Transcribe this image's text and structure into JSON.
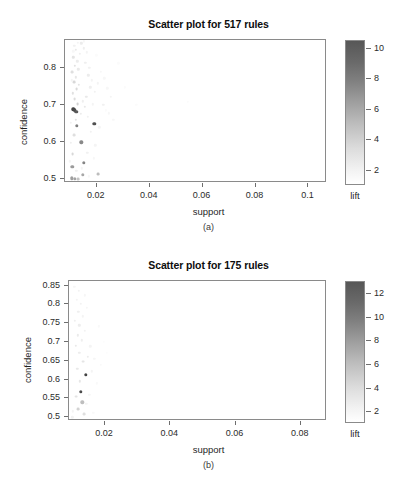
{
  "figures": [
    {
      "id": "a",
      "caption": "(a)",
      "title": "Scatter plot for 517 rules",
      "chart_data": {
        "type": "scatter",
        "title": "Scatter plot for 517 rules",
        "xlabel": "support",
        "ylabel": "confidence",
        "legend_title": "lift",
        "legend_position": "right",
        "grid": false,
        "colormap": "grey (white = low lift, dark grey = high lift)",
        "xlim": [
          0.008,
          0.107
        ],
        "ylim": [
          0.49,
          0.875
        ],
        "xticks": [
          0.02,
          0.04,
          0.06,
          0.08,
          0.1
        ],
        "xtick_labels": [
          "0.02",
          "0.04",
          "0.06",
          "0.08",
          "0.1"
        ],
        "yticks": [
          0.5,
          0.6,
          0.7,
          0.8
        ],
        "ytick_labels": [
          "0.5",
          "0.6",
          "0.7",
          "0.8"
        ],
        "color_range": [
          1,
          10.5
        ],
        "color_ticks": [
          2,
          4,
          6,
          8,
          10
        ],
        "color_tick_labels": [
          "2",
          "4",
          "6",
          "8",
          "10"
        ],
        "n_rules": 517,
        "points": [
          {
            "support": 0.0112,
            "confidence": 0.688,
            "lift": 9.8
          },
          {
            "support": 0.0118,
            "confidence": 0.686,
            "lift": 9.4
          },
          {
            "support": 0.0122,
            "confidence": 0.681,
            "lift": 8.6
          },
          {
            "support": 0.019,
            "confidence": 0.65,
            "lift": 9.1
          },
          {
            "support": 0.0125,
            "confidence": 0.644,
            "lift": 6.6
          },
          {
            "support": 0.0142,
            "confidence": 0.6,
            "lift": 6.1
          },
          {
            "support": 0.015,
            "confidence": 0.544,
            "lift": 6.3
          },
          {
            "support": 0.0107,
            "confidence": 0.533,
            "lift": 5.2
          },
          {
            "support": 0.0148,
            "confidence": 0.512,
            "lift": 4.6
          },
          {
            "support": 0.0205,
            "confidence": 0.515,
            "lift": 3.6
          },
          {
            "support": 0.0105,
            "confidence": 0.503,
            "lift": 5.0
          },
          {
            "support": 0.0117,
            "confidence": 0.502,
            "lift": 4.8
          },
          {
            "support": 0.0131,
            "confidence": 0.5,
            "lift": 3.3
          },
          {
            "support": 0.0109,
            "confidence": 0.568,
            "lift": 2.4
          },
          {
            "support": 0.0113,
            "confidence": 0.62,
            "lift": 2.1
          },
          {
            "support": 0.0121,
            "confidence": 0.66,
            "lift": 2.0
          },
          {
            "support": 0.0128,
            "confidence": 0.703,
            "lift": 2.6
          },
          {
            "support": 0.0116,
            "confidence": 0.716,
            "lift": 2.2
          },
          {
            "support": 0.011,
            "confidence": 0.731,
            "lift": 2.0
          },
          {
            "support": 0.0124,
            "confidence": 0.742,
            "lift": 2.3
          },
          {
            "support": 0.0133,
            "confidence": 0.755,
            "lift": 1.9
          },
          {
            "support": 0.0114,
            "confidence": 0.762,
            "lift": 2.4
          },
          {
            "support": 0.0121,
            "confidence": 0.775,
            "lift": 1.8
          },
          {
            "support": 0.0108,
            "confidence": 0.788,
            "lift": 2.1
          },
          {
            "support": 0.013,
            "confidence": 0.796,
            "lift": 1.7
          },
          {
            "support": 0.0118,
            "confidence": 0.805,
            "lift": 2.0
          },
          {
            "support": 0.0126,
            "confidence": 0.818,
            "lift": 1.6
          },
          {
            "support": 0.0111,
            "confidence": 0.828,
            "lift": 1.9
          },
          {
            "support": 0.0136,
            "confidence": 0.838,
            "lift": 1.5
          },
          {
            "support": 0.012,
            "confidence": 0.849,
            "lift": 1.7
          },
          {
            "support": 0.0115,
            "confidence": 0.86,
            "lift": 1.4
          },
          {
            "support": 0.0141,
            "confidence": 0.866,
            "lift": 1.6
          },
          {
            "support": 0.0152,
            "confidence": 0.853,
            "lift": 1.5
          },
          {
            "support": 0.0163,
            "confidence": 0.842,
            "lift": 1.3
          },
          {
            "support": 0.0157,
            "confidence": 0.813,
            "lift": 1.5
          },
          {
            "support": 0.0172,
            "confidence": 0.8,
            "lift": 1.4
          },
          {
            "support": 0.0168,
            "confidence": 0.78,
            "lift": 1.6
          },
          {
            "support": 0.0181,
            "confidence": 0.766,
            "lift": 1.3
          },
          {
            "support": 0.0176,
            "confidence": 0.748,
            "lift": 1.5
          },
          {
            "support": 0.0192,
            "confidence": 0.735,
            "lift": 1.4
          },
          {
            "support": 0.0161,
            "confidence": 0.722,
            "lift": 1.7
          },
          {
            "support": 0.0147,
            "confidence": 0.71,
            "lift": 1.5
          },
          {
            "support": 0.0155,
            "confidence": 0.695,
            "lift": 1.8
          },
          {
            "support": 0.0139,
            "confidence": 0.676,
            "lift": 1.6
          },
          {
            "support": 0.0166,
            "confidence": 0.668,
            "lift": 1.4
          },
          {
            "support": 0.0185,
            "confidence": 0.702,
            "lift": 1.3
          },
          {
            "support": 0.0204,
            "confidence": 0.758,
            "lift": 1.3
          },
          {
            "support": 0.0215,
            "confidence": 0.79,
            "lift": 1.2
          },
          {
            "support": 0.0228,
            "confidence": 0.772,
            "lift": 1.2
          },
          {
            "support": 0.024,
            "confidence": 0.745,
            "lift": 1.2
          },
          {
            "support": 0.0252,
            "confidence": 0.722,
            "lift": 1.3
          },
          {
            "support": 0.0225,
            "confidence": 0.7,
            "lift": 1.4
          },
          {
            "support": 0.0245,
            "confidence": 0.678,
            "lift": 1.2
          },
          {
            "support": 0.0263,
            "confidence": 0.66,
            "lift": 1.2
          },
          {
            "support": 0.0209,
            "confidence": 0.64,
            "lift": 1.3
          },
          {
            "support": 0.0178,
            "confidence": 0.628,
            "lift": 1.4
          },
          {
            "support": 0.0195,
            "confidence": 0.592,
            "lift": 1.3
          },
          {
            "support": 0.0165,
            "confidence": 0.572,
            "lift": 1.4
          },
          {
            "support": 0.0188,
            "confidence": 0.556,
            "lift": 1.2
          },
          {
            "support": 0.0144,
            "confidence": 0.53,
            "lift": 1.3
          },
          {
            "support": 0.0122,
            "confidence": 0.523,
            "lift": 1.5
          },
          {
            "support": 0.0169,
            "confidence": 0.508,
            "lift": 1.2
          },
          {
            "support": 0.0235,
            "confidence": 0.686,
            "lift": 1.1
          },
          {
            "support": 0.0305,
            "confidence": 0.748,
            "lift": 1.1
          },
          {
            "support": 0.035,
            "confidence": 0.7,
            "lift": 1.1
          },
          {
            "support": 0.0545,
            "confidence": 0.708,
            "lift": 1.1
          },
          {
            "support": 0.0555,
            "confidence": 0.66,
            "lift": 1.0
          },
          {
            "support": 0.0282,
            "confidence": 0.812,
            "lift": 1.1
          },
          {
            "support": 0.0198,
            "confidence": 0.834,
            "lift": 1.1
          },
          {
            "support": 0.015,
            "confidence": 0.872,
            "lift": 1.2
          },
          {
            "support": 0.0128,
            "confidence": 0.868,
            "lift": 1.3
          },
          {
            "support": 0.0112,
            "confidence": 0.845,
            "lift": 1.2
          },
          {
            "support": 0.0106,
            "confidence": 0.766,
            "lift": 1.3
          },
          {
            "support": 0.0103,
            "confidence": 0.652,
            "lift": 1.4
          },
          {
            "support": 0.0101,
            "confidence": 0.598,
            "lift": 1.5
          },
          {
            "support": 0.0099,
            "confidence": 0.548,
            "lift": 1.3
          }
        ]
      }
    },
    {
      "id": "b",
      "caption": "(b)",
      "title": "Scatter plot for 175 rules",
      "chart_data": {
        "type": "scatter",
        "title": "Scatter plot for 175 rules",
        "xlabel": "support",
        "ylabel": "confidence",
        "legend_title": "lift",
        "legend_position": "right",
        "grid": false,
        "colormap": "grey (white = low lift, dark grey = high lift)",
        "xlim": [
          0.009,
          0.088
        ],
        "ylim": [
          0.49,
          0.862
        ],
        "xticks": [
          0.02,
          0.04,
          0.06,
          0.08
        ],
        "xtick_labels": [
          "0.02",
          "0.04",
          "0.06",
          "0.08"
        ],
        "yticks": [
          0.5,
          0.55,
          0.6,
          0.65,
          0.7,
          0.75,
          0.8,
          0.85
        ],
        "ytick_labels": [
          "0.5",
          "0.55",
          "0.6",
          "0.65",
          "0.7",
          "0.75",
          "0.8",
          "0.85"
        ],
        "color_range": [
          1,
          13
        ],
        "color_ticks": [
          2,
          4,
          6,
          8,
          10,
          12
        ],
        "color_tick_labels": [
          "2",
          "4",
          "6",
          "8",
          "10",
          "12"
        ],
        "n_rules": 175,
        "points": [
          {
            "support": 0.0141,
            "confidence": 0.613,
            "lift": 12.1
          },
          {
            "support": 0.0127,
            "confidence": 0.568,
            "lift": 11.6
          },
          {
            "support": 0.0131,
            "confidence": 0.54,
            "lift": 4.2
          },
          {
            "support": 0.0119,
            "confidence": 0.522,
            "lift": 3.0
          },
          {
            "support": 0.0136,
            "confidence": 0.508,
            "lift": 2.4
          },
          {
            "support": 0.0112,
            "confidence": 0.555,
            "lift": 2.2
          },
          {
            "support": 0.0124,
            "confidence": 0.595,
            "lift": 2.0
          },
          {
            "support": 0.0115,
            "confidence": 0.628,
            "lift": 1.9
          },
          {
            "support": 0.0133,
            "confidence": 0.648,
            "lift": 2.1
          },
          {
            "support": 0.0148,
            "confidence": 0.66,
            "lift": 1.8
          },
          {
            "support": 0.0122,
            "confidence": 0.672,
            "lift": 1.7
          },
          {
            "support": 0.011,
            "confidence": 0.69,
            "lift": 1.9
          },
          {
            "support": 0.0129,
            "confidence": 0.704,
            "lift": 1.6
          },
          {
            "support": 0.0117,
            "confidence": 0.718,
            "lift": 1.8
          },
          {
            "support": 0.0139,
            "confidence": 0.73,
            "lift": 1.5
          },
          {
            "support": 0.0121,
            "confidence": 0.744,
            "lift": 1.7
          },
          {
            "support": 0.0108,
            "confidence": 0.756,
            "lift": 1.6
          },
          {
            "support": 0.0132,
            "confidence": 0.768,
            "lift": 1.4
          },
          {
            "support": 0.0118,
            "confidence": 0.78,
            "lift": 1.6
          },
          {
            "support": 0.0145,
            "confidence": 0.79,
            "lift": 1.3
          },
          {
            "support": 0.0126,
            "confidence": 0.802,
            "lift": 1.5
          },
          {
            "support": 0.0113,
            "confidence": 0.812,
            "lift": 1.4
          },
          {
            "support": 0.0138,
            "confidence": 0.824,
            "lift": 1.3
          },
          {
            "support": 0.012,
            "confidence": 0.836,
            "lift": 1.5
          },
          {
            "support": 0.0106,
            "confidence": 0.846,
            "lift": 1.3
          },
          {
            "support": 0.0155,
            "confidence": 0.688,
            "lift": 1.4
          },
          {
            "support": 0.0168,
            "confidence": 0.655,
            "lift": 1.3
          },
          {
            "support": 0.016,
            "confidence": 0.622,
            "lift": 1.4
          },
          {
            "support": 0.0175,
            "confidence": 0.59,
            "lift": 1.2
          },
          {
            "support": 0.0152,
            "confidence": 0.56,
            "lift": 1.3
          },
          {
            "support": 0.0143,
            "confidence": 0.535,
            "lift": 1.4
          },
          {
            "support": 0.0164,
            "confidence": 0.512,
            "lift": 1.2
          },
          {
            "support": 0.0188,
            "confidence": 0.64,
            "lift": 1.2
          },
          {
            "support": 0.0196,
            "confidence": 0.7,
            "lift": 1.1
          },
          {
            "support": 0.0182,
            "confidence": 0.742,
            "lift": 1.2
          },
          {
            "support": 0.0205,
            "confidence": 0.672,
            "lift": 1.1
          },
          {
            "support": 0.01,
            "confidence": 0.5,
            "lift": 1.5
          },
          {
            "support": 0.0102,
            "confidence": 0.516,
            "lift": 1.4
          }
        ]
      }
    }
  ]
}
